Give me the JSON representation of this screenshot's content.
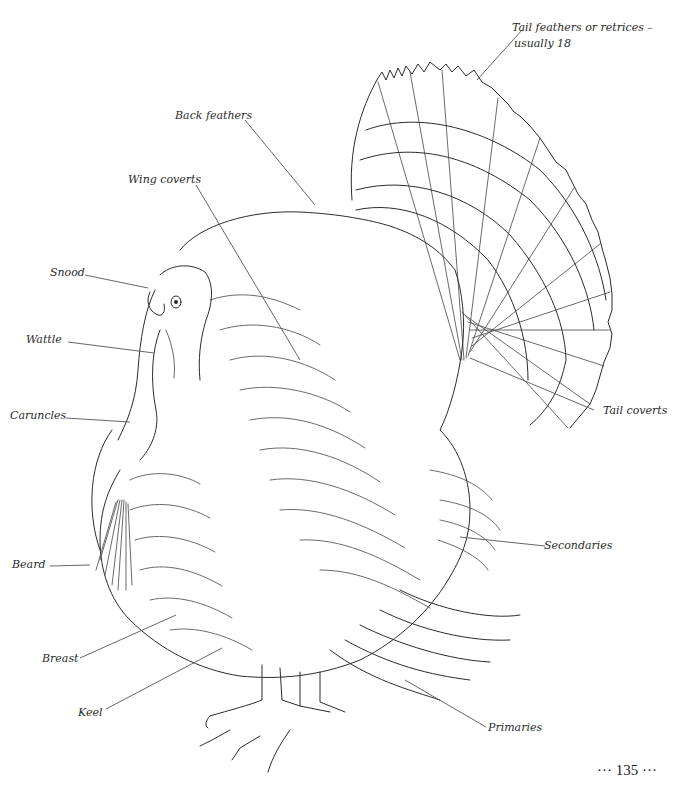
{
  "figure": {
    "labels": {
      "tail_feathers": "Tail feathers or retrices –\nusually 18",
      "tail_feathers_line1": "Tail feathers or retrices –",
      "tail_feathers_line2": "usually 18",
      "back_feathers": "Back feathers",
      "wing_coverts": "Wing coverts",
      "snood": "Snood",
      "wattle": "Wattle",
      "caruncles": "Caruncles",
      "tail_coverts": "Tail coverts",
      "secondaries": "Secondaries",
      "beard": "Beard",
      "breast": "Breast",
      "keel": "Keel",
      "primaries": "Primaries"
    },
    "page_number": "··· 135 ···"
  }
}
